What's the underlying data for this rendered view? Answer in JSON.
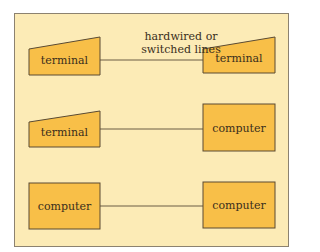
{
  "diagram": {
    "caption": "hardwired or switched lines",
    "caption_lines": [
      "hardwired or",
      "switched lines"
    ],
    "colors": {
      "panel_bg": "#fcebb6",
      "node_fill": "#f8bf48",
      "stroke": "#5a4a32",
      "line": "#6b5c45"
    },
    "rows": [
      {
        "left": {
          "type": "terminal",
          "label": "terminal"
        },
        "right": {
          "type": "terminal",
          "label": "terminal"
        }
      },
      {
        "left": {
          "type": "terminal",
          "label": "terminal"
        },
        "right": {
          "type": "computer",
          "label": "computer"
        }
      },
      {
        "left": {
          "type": "computer",
          "label": "computer"
        },
        "right": {
          "type": "computer",
          "label": "computer"
        }
      }
    ]
  }
}
